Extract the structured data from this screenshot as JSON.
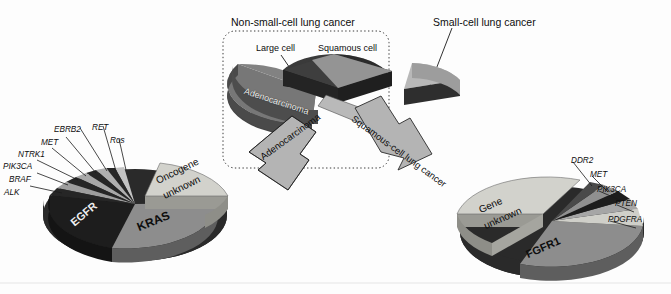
{
  "figure": {
    "title_nsclc": "Non-small-cell lung cancer",
    "title_sclc": "Small-cell lung cancer",
    "label_large_cell": "Large cell",
    "label_squamous_cell": "Squamous cell",
    "label_adenocarcinoma_slice": "Adenocarcinoma",
    "arrow_left": "Adenocarcinoma",
    "arrow_right": "Squamous-cell lung cancer"
  },
  "colors": {
    "dark": "#1c1c1c",
    "mid_dark": "#3d3d3d",
    "mid": "#8f8f8f",
    "mid_light": "#a8a8a8",
    "light": "#c9c9c9",
    "pale": "#dcdcd6",
    "edge": "#5a5a5a",
    "arrow_fill": "#b4b4b4",
    "arrow_stroke": "#2a2a2a",
    "box_stroke": "#3a3a3a",
    "background": "#fdfdfd"
  },
  "chart_data": [
    {
      "type": "pie",
      "name": "lung-cancer-histology",
      "title": "Non-small-cell lung cancer",
      "categories": [
        "Adenocarcinoma",
        "Large cell",
        "Squamous cell",
        "Small-cell lung cancer"
      ],
      "values": [
        40,
        10,
        30,
        20
      ],
      "exploded": [
        "Large cell",
        "Squamous cell",
        "Small-cell lung cancer"
      ],
      "legend": "labels-on-slices",
      "grid": false
    },
    {
      "type": "pie",
      "name": "adenocarcinoma-oncogenes",
      "title": "Adenocarcinoma",
      "categories": [
        "Oncogene unknown",
        "KRAS",
        "EGFR",
        "ALK",
        "BRAF",
        "PIK3CA",
        "NTRK1",
        "MET",
        "EBRB2",
        "RET",
        "Ros"
      ],
      "values": [
        31,
        25,
        23,
        4,
        3,
        2.5,
        2,
        2,
        2,
        2.5,
        3
      ],
      "exploded": [
        "Oncogene unknown"
      ],
      "legend": "leader-lines",
      "grid": false
    },
    {
      "type": "pie",
      "name": "squamous-cell-genes",
      "title": "Squamous-cell lung cancer",
      "categories": [
        "Gene unknown",
        "FGFR1",
        "PDGFRA",
        "PTEN",
        "PIK3CA",
        "MET",
        "DDR2"
      ],
      "values": [
        40,
        26,
        10,
        8,
        6,
        5,
        5
      ],
      "exploded": [
        "Gene unknown"
      ],
      "legend": "leader-lines",
      "grid": false
    }
  ],
  "adeno_labels": [
    {
      "text": "ALK",
      "x": 4,
      "y": 188
    },
    {
      "text": "BRAF",
      "x": 9,
      "y": 175
    },
    {
      "text": "PIK3CA",
      "x": 3,
      "y": 162
    },
    {
      "text": "NTRK1",
      "x": 18,
      "y": 150
    },
    {
      "text": "MET",
      "x": 41,
      "y": 138
    },
    {
      "text": "EBRB2",
      "x": 54,
      "y": 125
    },
    {
      "text": "RET",
      "x": 92,
      "y": 123
    },
    {
      "text": "Ros",
      "x": 110,
      "y": 136
    }
  ],
  "squamous_labels": [
    {
      "text": "DDR2",
      "x": 571,
      "y": 156
    },
    {
      "text": "MET",
      "x": 590,
      "y": 170
    },
    {
      "text": "PIK3CA",
      "x": 597,
      "y": 185
    },
    {
      "text": "PTEN",
      "x": 615,
      "y": 199
    },
    {
      "text": "PDGFRA",
      "x": 608,
      "y": 215
    }
  ],
  "slice_text": {
    "oncogene_unknown_1": "Oncogene",
    "oncogene_unknown_2": "unknown",
    "kras": "KRAS",
    "egfr": "EGFR",
    "gene_unknown_1": "Gene",
    "gene_unknown_2": "unknown",
    "fgfr1": "FGFR1"
  }
}
